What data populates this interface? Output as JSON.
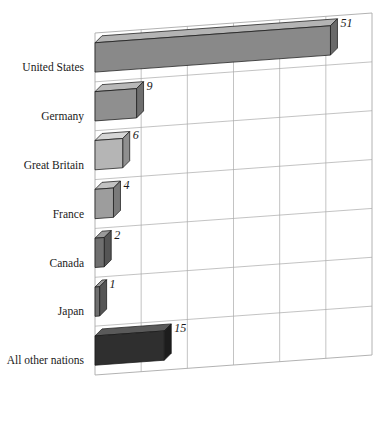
{
  "chart_data": {
    "type": "bar",
    "title": "",
    "subtitle": "",
    "xlabel": "",
    "ylabel": "",
    "orientation": "horizontal",
    "style": "3d-skewed-horizontal-bar",
    "grid": true,
    "legend": false,
    "legend_position": "none",
    "xlim": [
      0,
      60
    ],
    "x_gridline_values": [
      10,
      20,
      30,
      40,
      50,
      60
    ],
    "categories": [
      "United States",
      "Germany",
      "Great Britain",
      "France",
      "Canada",
      "Japan",
      "All other nations"
    ],
    "values": [
      51,
      9,
      6,
      4,
      2,
      1,
      15
    ],
    "value_labels": [
      "51",
      "9",
      "6",
      "4",
      "2",
      "1",
      "15"
    ],
    "bar_colors": [
      "#898989",
      "#8f8f8f",
      "#b5b5b5",
      "#9d9d9d",
      "#6f6f6f",
      "#6f6f6f",
      "#2f2f2f"
    ],
    "bar_top_colors": [
      "#b4b4b4",
      "#b8b8b8",
      "#d6d6d6",
      "#c2c2c2",
      "#9a9a9a",
      "#9a9a9a",
      "#5a5a5a"
    ],
    "bar_side_colors": [
      "#6a6a6a",
      "#6e6e6e",
      "#8f8f8f",
      "#7a7a7a",
      "#555555",
      "#555555",
      "#1d1d1d"
    ],
    "grid_color": "#a9a9a9",
    "axis_color": "#8a8a8a",
    "text_color": "#1a1a1a",
    "background": "#ffffff"
  },
  "labels": {
    "categories": [
      "United States",
      "Germany",
      "Great Britain",
      "France",
      "Canada",
      "Japan",
      "All other nations"
    ],
    "values": [
      "51",
      "9",
      "6",
      "4",
      "2",
      "1",
      "15"
    ]
  }
}
